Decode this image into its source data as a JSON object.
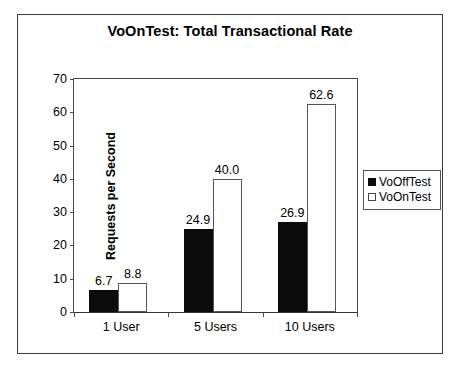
{
  "chart_data": {
    "type": "bar",
    "title": "VoOnTest: Total Transactional Rate",
    "xlabel": "",
    "ylabel": "Requests per Second",
    "categories": [
      "1 User",
      "5 Users",
      "10 Users"
    ],
    "series": [
      {
        "name": "VoOffTest",
        "values": [
          6.7,
          24.9,
          26.9
        ],
        "color": "#0b0b0b",
        "fill": "solid-black"
      },
      {
        "name": "VoOnTest",
        "values": [
          8.8,
          40.0,
          62.6
        ],
        "color": "#ffffff",
        "fill": "white-outlined"
      }
    ],
    "data_labels": [
      [
        "6.7",
        "8.8"
      ],
      [
        "24.9",
        "40.0"
      ],
      [
        "26.9",
        "62.6"
      ]
    ],
    "ylim": [
      0,
      70
    ],
    "ytick_values": [
      0,
      10,
      20,
      30,
      40,
      50,
      60,
      70
    ],
    "ytick_labels": [
      "0",
      "10",
      "20",
      "30",
      "40",
      "50",
      "60",
      "70"
    ],
    "grid": false,
    "legend_position": "right"
  },
  "legend": {
    "entries": [
      {
        "label": "VoOffTest",
        "swatch": "filled-black-square"
      },
      {
        "label": "VoOnTest",
        "swatch": "empty-white-square"
      }
    ]
  }
}
